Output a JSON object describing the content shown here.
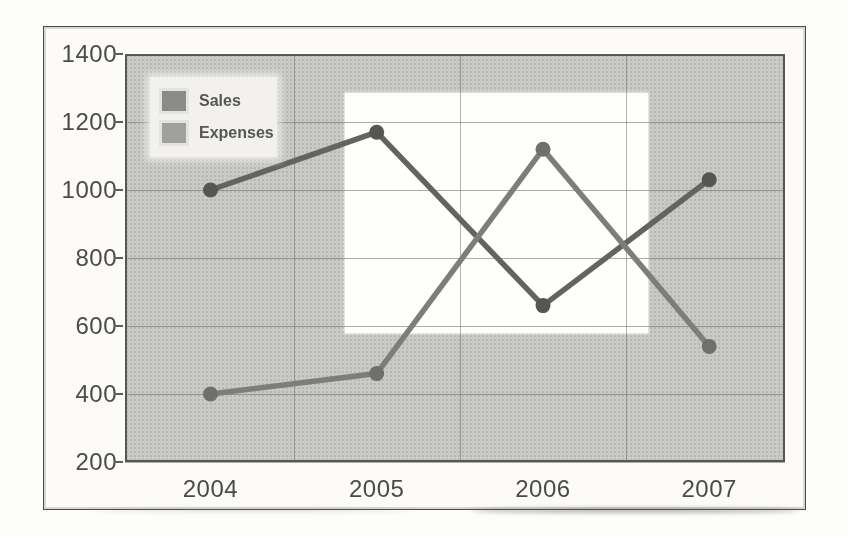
{
  "figure": {
    "page_background": "#fdfdfc",
    "frame_color": "#4a4a46"
  },
  "legend": {
    "background": "#f4f3ee",
    "text_color": "#565654",
    "items": [
      {
        "label": "Sales",
        "swatch_color": "#8b8b88"
      },
      {
        "label": "Expenses",
        "swatch_color": "#a0a09d"
      }
    ]
  },
  "chart_data": {
    "type": "line",
    "title": "",
    "xlabel": "",
    "ylabel": "",
    "categories": [
      "2004",
      "2005",
      "2006",
      "2007"
    ],
    "series": [
      {
        "name": "Sales",
        "values": [
          1000,
          1170,
          660,
          1030
        ],
        "line_color": "#636360",
        "point_color": "#555552"
      },
      {
        "name": "Expenses",
        "values": [
          400,
          460,
          1120,
          540
        ],
        "line_color": "#7d7d7a",
        "point_color": "#6f6f6c"
      }
    ],
    "ylim": [
      200,
      1400
    ],
    "yticks": [
      "1400",
      "1200",
      "1000",
      "800",
      "600",
      "400",
      "200"
    ],
    "grid": true,
    "legend_position": "top-left-inside",
    "plot_background": "#c9c9c6",
    "gridline_color": "#686864",
    "highlight_region": {
      "shape": "white-rectangle",
      "x0_frac": 0.333,
      "x1_frac": 0.792,
      "y0_value": 580,
      "y1_value": 1285,
      "color": "#fefefb"
    }
  }
}
